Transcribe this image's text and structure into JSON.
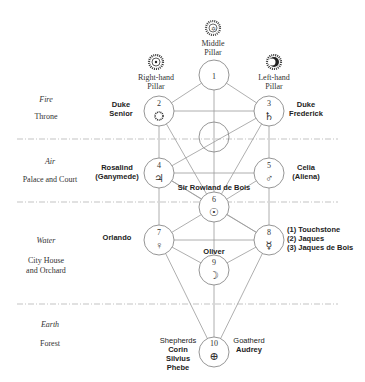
{
  "pillars": {
    "middle": {
      "label_line1": "Middle",
      "label_line2": "Pillar",
      "icon": "sun-rays-star-icon"
    },
    "right": {
      "label_line1": "Right-hand",
      "label_line2": "Pillar",
      "icon": "sun-rays-dot-icon"
    },
    "left": {
      "label_line1": "Left-hand",
      "label_line2": "Pillar",
      "icon": "sun-rays-dark-icon"
    }
  },
  "levels": [
    {
      "element": "Fire",
      "place": "Throne"
    },
    {
      "element": "Air",
      "place": "Palace and Court"
    },
    {
      "element": "Water",
      "place_line1": "City House",
      "place_line2": "and Orchard"
    },
    {
      "element": "Earth",
      "place": "Forest"
    }
  ],
  "sephiroth": [
    {
      "num": "1",
      "symbol": ""
    },
    {
      "num": "2",
      "symbol": "✺"
    },
    {
      "num": "3",
      "symbol": "♄"
    },
    {
      "num": "4",
      "symbol": "♃"
    },
    {
      "num": "5",
      "symbol": "♂"
    },
    {
      "num": "6",
      "symbol": "☉"
    },
    {
      "num": "7",
      "symbol": "♀"
    },
    {
      "num": "8",
      "symbol": "☿"
    },
    {
      "num": "9",
      "symbol": "☽"
    },
    {
      "num": "10",
      "symbol": "⊕"
    }
  ],
  "characters": {
    "duke_senior": {
      "line1": "Duke",
      "line2": "Senior"
    },
    "duke_frederick": {
      "line1": "Duke",
      "line2": "Frederick"
    },
    "rosalind": {
      "line1": "Rosalind",
      "line2": "(Ganymede)"
    },
    "celia": {
      "line1": "Celia",
      "line2": "(Aliena)"
    },
    "sir_rowland": "Sir Rowland de Bois",
    "orlando": "Orlando",
    "sephirah8": [
      "(1) Touchstone",
      "(2) Jaques",
      "(3) Jaques de Bois"
    ],
    "oliver": "Oliver",
    "shepherds": {
      "heading": "Shepherds",
      "names": [
        "Corin",
        "Silvius",
        "Phebe"
      ]
    },
    "goatherd": {
      "heading": "Goatherd",
      "name": "Audrey"
    }
  }
}
